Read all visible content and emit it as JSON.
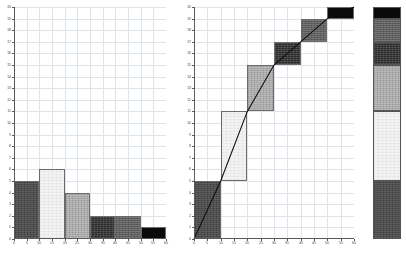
{
  "header": {
    "note": "Microsoft Excel - Book1"
  },
  "chart_data": [
    {
      "type": "bar",
      "name": "frequency-histogram",
      "title": "",
      "xlabel": "",
      "ylabel": "",
      "categories": [
        "0-10",
        "10-20",
        "20-30",
        "30-40",
        "40-50",
        "50-60"
      ],
      "bin_edges": [
        0,
        10,
        20,
        30,
        40,
        50,
        60
      ],
      "values": [
        5,
        6,
        4,
        2,
        2,
        1
      ],
      "xlim": [
        0,
        60
      ],
      "ylim": [
        0,
        20
      ],
      "xticks": [
        0,
        5,
        10,
        15,
        20,
        25,
        30,
        35,
        40,
        45,
        50,
        55,
        60
      ],
      "yticks": [
        0,
        1,
        2,
        3,
        4,
        5,
        6,
        7,
        8,
        9,
        10,
        11,
        12,
        13,
        14,
        15,
        16,
        17,
        18,
        19,
        20
      ],
      "grid": true,
      "legend": "none",
      "bar_colors": [
        "#4d4d4d",
        "#f3f3f3",
        "#a9a9a9",
        "#2b2b2b",
        "#5e5e5e",
        "#0a0a0a"
      ],
      "bar_fill_names": [
        "fill-darkgray",
        "fill-white",
        "fill-lightgray",
        "fill-verydark",
        "fill-meddark",
        "fill-black"
      ]
    },
    {
      "type": "bar",
      "name": "cumulative-ogive",
      "title": "",
      "xlabel": "",
      "ylabel": "",
      "categories": [
        "0-10",
        "10-20",
        "20-30",
        "30-40",
        "40-50",
        "50-60"
      ],
      "bin_edges": [
        0,
        10,
        20,
        30,
        40,
        50,
        60
      ],
      "values": [
        5,
        6,
        4,
        2,
        2,
        1
      ],
      "cumulative": [
        5,
        11,
        15,
        17,
        19,
        20
      ],
      "segment_bottoms": [
        0,
        5,
        11,
        15,
        17,
        19
      ],
      "segment_tops": [
        5,
        11,
        15,
        17,
        19,
        20
      ],
      "line_points": [
        [
          0,
          0
        ],
        [
          10,
          5
        ],
        [
          20,
          11
        ],
        [
          30,
          15
        ],
        [
          40,
          17
        ],
        [
          50,
          19
        ],
        [
          60,
          20
        ]
      ],
      "xlim": [
        0,
        60
      ],
      "ylim": [
        0,
        20
      ],
      "xticks": [
        0,
        5,
        10,
        15,
        20,
        25,
        30,
        35,
        40,
        45,
        50,
        55,
        60
      ],
      "yticks": [
        0,
        1,
        2,
        3,
        4,
        5,
        6,
        7,
        8,
        9,
        10,
        11,
        12,
        13,
        14,
        15,
        16,
        17,
        18,
        19,
        20
      ],
      "grid": true,
      "legend": "none",
      "line_color": "#101010",
      "bar_colors": [
        "#4d4d4d",
        "#f3f3f3",
        "#a9a9a9",
        "#2b2b2b",
        "#5e5e5e",
        "#0a0a0a"
      ],
      "bar_fill_names": [
        "fill-darkgray",
        "fill-white",
        "fill-lightgray",
        "fill-verydark",
        "fill-meddark",
        "fill-black"
      ]
    },
    {
      "type": "bar",
      "name": "stacked-column",
      "title": "",
      "xlabel": "",
      "ylabel": "",
      "categories": [
        "total"
      ],
      "stacked": true,
      "series": [
        {
          "name": "0-10",
          "values": [
            5
          ],
          "color": "#4d4d4d",
          "fill_name": "fill-darkgray"
        },
        {
          "name": "10-20",
          "values": [
            6
          ],
          "color": "#f3f3f3",
          "fill_name": "fill-white"
        },
        {
          "name": "20-30",
          "values": [
            4
          ],
          "color": "#a9a9a9",
          "fill_name": "fill-lightgray"
        },
        {
          "name": "30-40",
          "values": [
            2
          ],
          "color": "#2b2b2b",
          "fill_name": "fill-verydark"
        },
        {
          "name": "40-50",
          "values": [
            2
          ],
          "color": "#5e5e5e",
          "fill_name": "fill-meddark"
        },
        {
          "name": "50-60",
          "values": [
            1
          ],
          "color": "#0a0a0a",
          "fill_name": "fill-black"
        }
      ],
      "ylim": [
        0,
        20
      ],
      "grid": true,
      "legend": "none"
    }
  ],
  "style": {
    "grid_color": "#dfe3ea",
    "axis_color": "#5a5a5a",
    "bar_border": "#6b6b6b",
    "background": "#ffffff"
  }
}
